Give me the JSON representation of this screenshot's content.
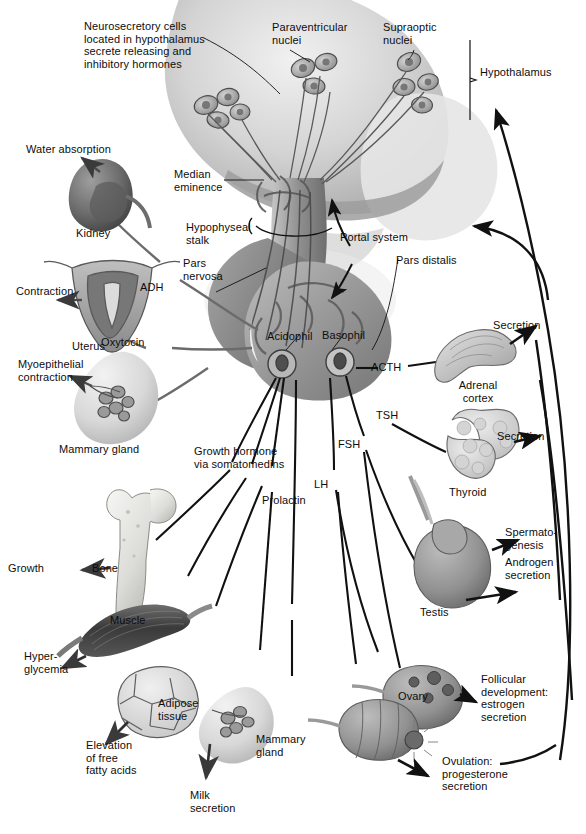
{
  "figure": {
    "type": "anatomical-diagram",
    "background_color": "#ffffff",
    "ink_color": "#111111"
  },
  "annotations": {
    "neurosecretory_cells": "Neurosecretory cells\nlocated in hypothalamus\nsecrete releasing and\ninhibitory hormones",
    "paraventricular_nuclei": "Paraventricular\nnuclei",
    "supraoptic_nuclei": "Supraoptic\nnuclei",
    "hypothalamus": "Hypothalamus",
    "median_eminence": "Median\neminence",
    "hypophyseal_stalk": "Hypophyseal\nstalk",
    "pars_nervosa": "Pars\nnervosa",
    "portal_system": "Portal system",
    "pars_distalis": "Pars distalis",
    "acidophil": "Acidophil",
    "basophil": "Basophil"
  },
  "hormones": {
    "adh": "ADH",
    "oxytocin": "Oxytocin",
    "acth": "ACTH",
    "tsh": "TSH",
    "fsh": "FSH",
    "lh": "LH",
    "prolactin": "Prolactin",
    "growth_hormone": "Growth hormone\nvia somatomedins"
  },
  "targets": {
    "kidney": "Kidney",
    "uterus": "Uterus",
    "mammary_gland_left": "Mammary gland",
    "bone": "Bone",
    "muscle": "Muscle",
    "adipose_tissue": "Adipose\ntissue",
    "mammary_gland_bottom": "Mammary\ngland",
    "ovary": "Ovary",
    "testis": "Testis",
    "adrenal_cortex": "Adrenal\ncortex",
    "thyroid": "Thyroid"
  },
  "effects": {
    "water_absorption": "Water absorption",
    "contraction": "Contraction",
    "myoepithelial_contraction": "Myoepithelial\ncontraction",
    "growth": "Growth",
    "hyperglycemia": "Hyper-\nglycemia",
    "elevation_ffa": "Elevation\nof free\nfatty acids",
    "milk_secretion": "Milk\nsecretion",
    "follicular_development": "Follicular\ndevelopment:\nestrogen\nsecretion",
    "ovulation": "Ovulation:\nprogesterone\nsecretion",
    "spermatogenesis": "Spermato-\ngenesis",
    "androgen_secretion": "Androgen\nsecretion",
    "adrenal_secretion": "Secretion",
    "thyroid_secretion": "Secretion"
  }
}
